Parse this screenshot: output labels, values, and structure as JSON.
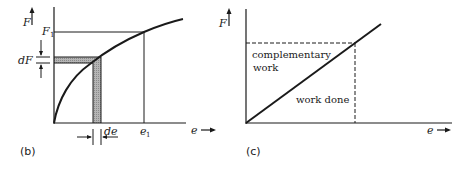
{
  "panels": [
    {
      "id": "b",
      "caption": "(b)",
      "y_axis_label": "F",
      "x_axis_label": "e",
      "f1_label": "F",
      "f1_sub": "1",
      "e1_label": "e",
      "e1_sub": "1",
      "dF_label": "dF",
      "de_label": "de"
    },
    {
      "id": "c",
      "caption": "(c)",
      "y_axis_label": "F",
      "x_axis_label": "e",
      "region_upper_line1": "complementary",
      "region_upper_line2": "work",
      "region_lower": "work done"
    }
  ],
  "colors": {
    "ink": "#1a1a1a",
    "hatch": "#9a9a9a",
    "background": "#ffffff"
  }
}
